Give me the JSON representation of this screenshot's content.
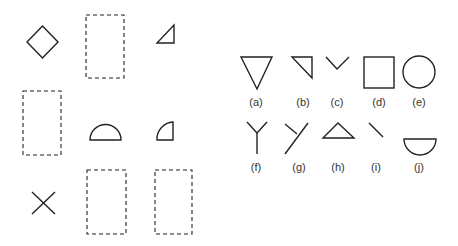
{
  "puzzle": {
    "grid_cells": [
      {
        "row": 0,
        "col": 0,
        "content": "diamond"
      },
      {
        "row": 0,
        "col": 1,
        "content": "empty"
      },
      {
        "row": 0,
        "col": 2,
        "content": "small right triangle"
      },
      {
        "row": 1,
        "col": 0,
        "content": "empty"
      },
      {
        "row": 1,
        "col": 1,
        "content": "half circle"
      },
      {
        "row": 1,
        "col": 2,
        "content": "quarter circle"
      },
      {
        "row": 2,
        "col": 0,
        "content": "x cross"
      },
      {
        "row": 2,
        "col": 1,
        "content": "empty"
      },
      {
        "row": 2,
        "col": 2,
        "content": "empty"
      }
    ]
  },
  "options": [
    {
      "label": "(a)",
      "shape": "downward triangle"
    },
    {
      "label": "(b)",
      "shape": "right triangle"
    },
    {
      "label": "(c)",
      "shape": "v chevron"
    },
    {
      "label": "(d)",
      "shape": "square"
    },
    {
      "label": "(e)",
      "shape": "circle"
    },
    {
      "label": "(f)",
      "shape": "y fork"
    },
    {
      "label": "(g)",
      "shape": "rotated y fork"
    },
    {
      "label": "(h)",
      "shape": "upward triangle"
    },
    {
      "label": "(i)",
      "shape": "diagonal line"
    },
    {
      "label": "(j)",
      "shape": "downward half circle"
    }
  ]
}
